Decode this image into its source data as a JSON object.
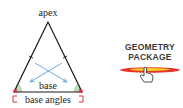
{
  "diagram": {
    "labels": {
      "apex": "apex",
      "base": "base",
      "base_angles": "base angles"
    },
    "colors": {
      "outline": "#1a1a1a",
      "angle_fill": "#a8d8a8",
      "arrow": "#5aa0d8",
      "angle_marker": "#e0304a"
    }
  },
  "logo": {
    "line1": "GEOMETRY",
    "line2": "PACKAGE",
    "icon": "hand-pointer-icon",
    "colors": {
      "text": "#3a3a3a",
      "swoosh_red": "#e8332a",
      "swoosh_yellow": "#f5d020"
    }
  }
}
